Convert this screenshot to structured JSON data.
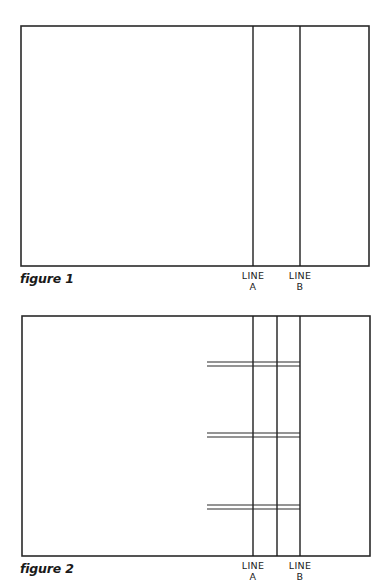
{
  "figures": [
    {
      "caption": "figure 1",
      "frame": {
        "x": 21,
        "y": 26,
        "w": 348,
        "h": 240
      },
      "vertical_lines": [
        253,
        300
      ],
      "horizontal_pairs": [],
      "labels": [
        {
          "x": 253,
          "line1": "LINE",
          "line2": "A"
        },
        {
          "x": 300,
          "line1": "LINE",
          "line2": "B"
        }
      ],
      "caption_pos": {
        "x": 20,
        "y": 271
      }
    },
    {
      "caption": "figure 2",
      "frame": {
        "x": 22,
        "y": 316,
        "w": 348,
        "h": 240
      },
      "vertical_lines": [
        253,
        277,
        300
      ],
      "horizontal_pairs": [
        {
          "x1": 207,
          "x2": 300,
          "y1": 362,
          "y2": 366
        },
        {
          "x1": 207,
          "x2": 300,
          "y1": 433,
          "y2": 437
        },
        {
          "x1": 207,
          "x2": 300,
          "y1": 505,
          "y2": 509
        }
      ],
      "labels": [
        {
          "x": 253,
          "line1": "LINE",
          "line2": "A"
        },
        {
          "x": 300,
          "line1": "LINE",
          "line2": "B"
        }
      ],
      "caption_pos": {
        "x": 20,
        "y": 561
      }
    }
  ],
  "label_offset_y": 4
}
